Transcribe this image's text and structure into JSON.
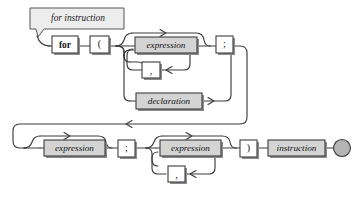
{
  "diagram": {
    "kind": "railroad-syntax-diagram",
    "title_banner": {
      "label": "for instruction",
      "fill": "#ededed",
      "stroke": "#555555"
    },
    "colors": {
      "nonterminal_fill": "#d4d4d4",
      "terminal_fill": "#ffffff",
      "line": "#3c3c3c",
      "shadow": "#8c8c8c",
      "end_circle_fill": "#b4b4b4",
      "background": "#ffffff"
    },
    "nodes": {
      "for_keyword": {
        "label": "for",
        "type": "terminal"
      },
      "open_paren": {
        "label": "(",
        "type": "terminal"
      },
      "expression_init": {
        "label": "expression",
        "type": "nonterminal"
      },
      "comma_init": {
        "label": ",",
        "type": "terminal"
      },
      "declaration": {
        "label": "declaration",
        "type": "nonterminal"
      },
      "semicolon_1": {
        "label": ";",
        "type": "terminal"
      },
      "expression_cond": {
        "label": "expression",
        "type": "nonterminal"
      },
      "semicolon_2": {
        "label": ";",
        "type": "terminal"
      },
      "expression_step": {
        "label": "expression",
        "type": "nonterminal"
      },
      "comma_step": {
        "label": ",",
        "type": "terminal"
      },
      "close_paren": {
        "label": ")",
        "type": "terminal"
      },
      "instruction": {
        "label": "instruction",
        "type": "nonterminal"
      },
      "end_marker": {
        "label": "",
        "type": "end-circle"
      }
    },
    "sequence_row1": [
      "for",
      "(",
      "expression",
      ",",
      "declaration",
      ";"
    ],
    "sequence_row2": [
      "expression",
      ";",
      "expression",
      ",",
      ")",
      "instruction"
    ],
    "arrow_markers": [
      {
        "name": "bypass-arrow-expression-init",
        "direction": "right"
      },
      {
        "name": "loop-arrow-comma-init",
        "direction": "left"
      },
      {
        "name": "arrow-after-declaration",
        "direction": "right"
      },
      {
        "name": "wrap-return-arrow",
        "direction": "left"
      },
      {
        "name": "bypass-arrow-expression-cond",
        "direction": "right"
      },
      {
        "name": "bypass-arrow-expression-step",
        "direction": "right"
      },
      {
        "name": "loop-arrow-comma-step",
        "direction": "left"
      }
    ]
  }
}
